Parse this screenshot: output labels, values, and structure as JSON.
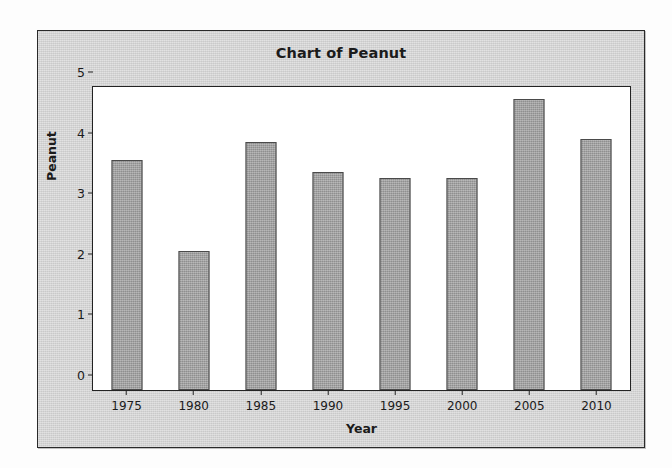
{
  "chart_data": {
    "type": "bar",
    "title": "Chart of Peanut",
    "xlabel": "Year",
    "ylabel": "Peanut",
    "categories": [
      "1975",
      "1980",
      "1985",
      "1990",
      "1995",
      "2000",
      "2005",
      "2010"
    ],
    "values": [
      3.8,
      2.3,
      4.1,
      3.6,
      3.5,
      3.5,
      4.8,
      4.15
    ],
    "ylim": [
      0,
      5
    ],
    "yticks": [
      "0",
      "1",
      "2",
      "3",
      "4",
      "5"
    ],
    "ytick_values": [
      0,
      1,
      2,
      3,
      4,
      5
    ],
    "grid": false,
    "legend": false,
    "bar_color": "#9d9d9d",
    "bar_edge_color": "#4a4a4a",
    "panel_color": "#d3d3d3",
    "plot_background": "#ffffff",
    "text_color": "#1b1b1b"
  }
}
